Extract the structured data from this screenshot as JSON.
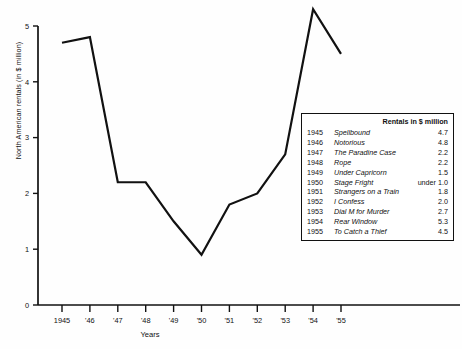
{
  "chart_data": {
    "type": "line",
    "title": "",
    "xlabel": "Years",
    "ylabel": "North American rentals (in $ million)",
    "categories": [
      "1945",
      "'46",
      "'47",
      "'48",
      "'49",
      "'50",
      "'51",
      "'52",
      "'53",
      "'54",
      "'55"
    ],
    "x": [
      1945,
      1946,
      1947,
      1948,
      1949,
      1950,
      1951,
      1952,
      1953,
      1954,
      1955
    ],
    "values": [
      4.7,
      4.8,
      2.2,
      2.2,
      1.5,
      0.9,
      1.8,
      2.0,
      2.7,
      5.3,
      4.5
    ],
    "ylim": [
      0,
      5
    ],
    "xlim": [
      1945,
      1955
    ],
    "yticks": [
      "0",
      "1",
      "2",
      "3",
      "4",
      "5"
    ],
    "grid": false,
    "legend_position": "inside-right",
    "line_color": "#111111",
    "series": [
      {
        "name": "North American rentals",
        "values": [
          4.7,
          4.8,
          2.2,
          2.2,
          1.5,
          0.9,
          1.8,
          2.0,
          2.7,
          5.3,
          4.5
        ]
      }
    ]
  },
  "legend": {
    "header": "Rentals in $ million",
    "rows": [
      {
        "year": "1945",
        "title": "Spellbound",
        "value": "4.7"
      },
      {
        "year": "1946",
        "title": "Notorious",
        "value": "4.8"
      },
      {
        "year": "1947",
        "title": "The Paradine Case",
        "value": "2.2"
      },
      {
        "year": "1948",
        "title": "Rope",
        "value": "2.2"
      },
      {
        "year": "1949",
        "title": "Under Capricorn",
        "value": "1.5"
      },
      {
        "year": "1950",
        "title": "Stage Fright",
        "value": "under 1.0"
      },
      {
        "year": "1951",
        "title": "Strangers on a Train",
        "value": "1.8"
      },
      {
        "year": "1952",
        "title": "I Confess",
        "value": "2.0"
      },
      {
        "year": "1953",
        "title": "Dial M for Murder",
        "value": "2.7"
      },
      {
        "year": "1954",
        "title": "Rear Window",
        "value": "5.3"
      },
      {
        "year": "1955",
        "title": "To Catch a Thief",
        "value": "4.5"
      }
    ]
  },
  "axes": {
    "y_title": "North American rentals (in $ million)",
    "x_title": "Years"
  }
}
